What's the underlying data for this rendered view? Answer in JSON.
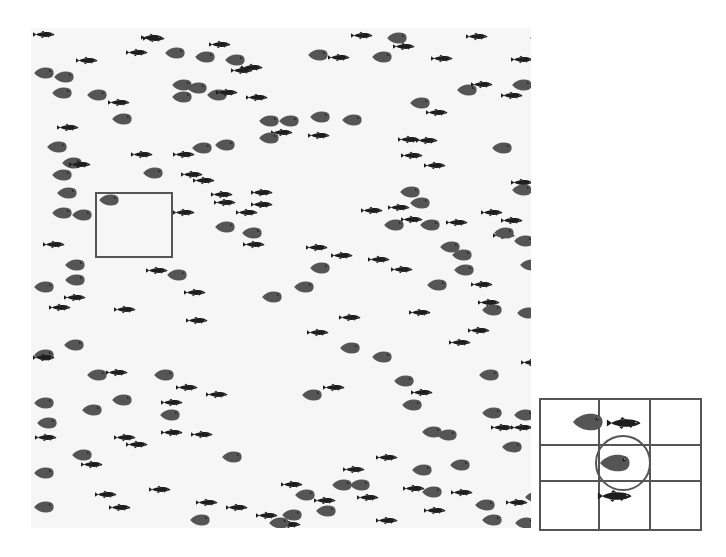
{
  "figure": {
    "colors": {
      "panel_bg": "#f6f6f6",
      "round_fish": "#555555",
      "small_fish": "#1e1e1e",
      "box_line": "#555555"
    }
  },
  "main_panel": {
    "x": 31,
    "y": 28,
    "width": 500,
    "height": 500
  },
  "selection_box": {
    "x": 95,
    "y": 192,
    "width": 78,
    "height": 66
  },
  "inset": {
    "x": 539,
    "y": 398,
    "width": 163,
    "height": 133,
    "grid": {
      "cols_x": [
        57,
        108
      ],
      "rows_y": [
        44,
        80
      ]
    },
    "circle": {
      "cx": 82,
      "cy": 63,
      "r": 28
    },
    "fish": [
      {
        "type": "round",
        "x": 28,
        "y": 12,
        "w": 38,
        "h": 20
      },
      {
        "type": "small",
        "x": 64,
        "y": 17,
        "w": 38,
        "h": 12
      },
      {
        "type": "round",
        "x": 57,
        "y": 53,
        "w": 34,
        "h": 20
      },
      {
        "type": "small",
        "x": 55,
        "y": 90,
        "w": 38,
        "h": 12
      }
    ]
  },
  "fish": [
    {
      "t": "s",
      "x": 2,
      "y": 2
    },
    {
      "t": "s",
      "x": 112,
      "y": 6
    },
    {
      "t": "r",
      "x": 133,
      "y": 18
    },
    {
      "t": "s",
      "x": 178,
      "y": 12
    },
    {
      "t": "s",
      "x": 210,
      "y": 35
    },
    {
      "t": "r",
      "x": 163,
      "y": 22
    },
    {
      "t": "r",
      "x": 2,
      "y": 38
    },
    {
      "t": "r",
      "x": 22,
      "y": 42
    },
    {
      "t": "r",
      "x": 20,
      "y": 58
    },
    {
      "t": "r",
      "x": 55,
      "y": 60
    },
    {
      "t": "s",
      "x": 77,
      "y": 70
    },
    {
      "t": "r",
      "x": 80,
      "y": 84
    },
    {
      "t": "s",
      "x": 26,
      "y": 95
    },
    {
      "t": "r",
      "x": 140,
      "y": 50
    },
    {
      "t": "r",
      "x": 155,
      "y": 53
    },
    {
      "t": "r",
      "x": 140,
      "y": 62
    },
    {
      "t": "r",
      "x": 175,
      "y": 60
    },
    {
      "t": "s",
      "x": 185,
      "y": 60
    },
    {
      "t": "s",
      "x": 215,
      "y": 65
    },
    {
      "t": "r",
      "x": 227,
      "y": 86
    },
    {
      "t": "r",
      "x": 247,
      "y": 86
    },
    {
      "t": "s",
      "x": 240,
      "y": 100
    },
    {
      "t": "r",
      "x": 227,
      "y": 103
    },
    {
      "t": "r",
      "x": 15,
      "y": 112
    },
    {
      "t": "s",
      "x": 100,
      "y": 122
    },
    {
      "t": "s",
      "x": 142,
      "y": 122
    },
    {
      "t": "r",
      "x": 160,
      "y": 113
    },
    {
      "t": "r",
      "x": 183,
      "y": 110
    },
    {
      "t": "s",
      "x": 150,
      "y": 142
    },
    {
      "t": "r",
      "x": 30,
      "y": 128
    },
    {
      "t": "r",
      "x": 20,
      "y": 140
    },
    {
      "t": "s",
      "x": 38,
      "y": 132
    },
    {
      "t": "r",
      "x": 25,
      "y": 158
    },
    {
      "t": "s",
      "x": 180,
      "y": 162
    },
    {
      "t": "s",
      "x": 220,
      "y": 160
    },
    {
      "t": "s",
      "x": 205,
      "y": 180
    },
    {
      "t": "r",
      "x": 67,
      "y": 165
    },
    {
      "t": "r",
      "x": 20,
      "y": 178
    },
    {
      "t": "s",
      "x": 12,
      "y": 212
    },
    {
      "t": "r",
      "x": 40,
      "y": 180
    },
    {
      "t": "s",
      "x": 95,
      "y": 20
    },
    {
      "t": "r",
      "x": 111,
      "y": 138
    },
    {
      "t": "s",
      "x": 45,
      "y": 28
    },
    {
      "t": "s",
      "x": 162,
      "y": 148
    },
    {
      "t": "s",
      "x": 220,
      "y": 172
    },
    {
      "t": "s",
      "x": 183,
      "y": 170
    },
    {
      "t": "r",
      "x": 183,
      "y": 192
    },
    {
      "t": "r",
      "x": 210,
      "y": 198
    },
    {
      "t": "s",
      "x": 142,
      "y": 180
    },
    {
      "t": "s",
      "x": 212,
      "y": 212
    },
    {
      "t": "r",
      "x": 33,
      "y": 230
    },
    {
      "t": "r",
      "x": 33,
      "y": 245
    },
    {
      "t": "r",
      "x": 135,
      "y": 240
    },
    {
      "t": "s",
      "x": 115,
      "y": 238
    },
    {
      "t": "r",
      "x": 2,
      "y": 252
    },
    {
      "t": "s",
      "x": 33,
      "y": 265
    },
    {
      "t": "s",
      "x": 18,
      "y": 275
    },
    {
      "t": "s",
      "x": 83,
      "y": 277
    },
    {
      "t": "s",
      "x": 153,
      "y": 260
    },
    {
      "t": "r",
      "x": 230,
      "y": 262
    },
    {
      "t": "s",
      "x": 155,
      "y": 288
    },
    {
      "t": "r",
      "x": 32,
      "y": 310
    },
    {
      "t": "r",
      "x": 2,
      "y": 320
    },
    {
      "t": "s",
      "x": 2,
      "y": 325
    },
    {
      "t": "r",
      "x": 55,
      "y": 340
    },
    {
      "t": "s",
      "x": 75,
      "y": 340
    },
    {
      "t": "r",
      "x": 122,
      "y": 340
    },
    {
      "t": "s",
      "x": 145,
      "y": 355
    },
    {
      "t": "s",
      "x": 175,
      "y": 362
    },
    {
      "t": "r",
      "x": 2,
      "y": 368
    },
    {
      "t": "r",
      "x": 80,
      "y": 365
    },
    {
      "t": "r",
      "x": 50,
      "y": 375
    },
    {
      "t": "s",
      "x": 130,
      "y": 370
    },
    {
      "t": "r",
      "x": 128,
      "y": 380
    },
    {
      "t": "r",
      "x": 5,
      "y": 388
    },
    {
      "t": "s",
      "x": 4,
      "y": 405
    },
    {
      "t": "s",
      "x": 83,
      "y": 405
    },
    {
      "t": "s",
      "x": 95,
      "y": 412
    },
    {
      "t": "s",
      "x": 130,
      "y": 400
    },
    {
      "t": "s",
      "x": 160,
      "y": 402
    },
    {
      "t": "r",
      "x": 40,
      "y": 420
    },
    {
      "t": "s",
      "x": 50,
      "y": 432
    },
    {
      "t": "r",
      "x": 2,
      "y": 438
    },
    {
      "t": "s",
      "x": 64,
      "y": 462
    },
    {
      "t": "s",
      "x": 118,
      "y": 457
    },
    {
      "t": "r",
      "x": 2,
      "y": 472
    },
    {
      "t": "s",
      "x": 78,
      "y": 475
    },
    {
      "t": "r",
      "x": 158,
      "y": 485
    },
    {
      "t": "s",
      "x": 165,
      "y": 470
    },
    {
      "t": "s",
      "x": 195,
      "y": 475
    },
    {
      "t": "s",
      "x": 225,
      "y": 483
    },
    {
      "t": "s",
      "x": 248,
      "y": 492
    },
    {
      "t": "r",
      "x": 237,
      "y": 488
    },
    {
      "t": "r",
      "x": 190,
      "y": 422
    },
    {
      "t": "r",
      "x": 250,
      "y": 480
    },
    {
      "t": "s",
      "x": 110,
      "y": 5
    },
    {
      "t": "r",
      "x": 193,
      "y": 25
    },
    {
      "t": "s",
      "x": 200,
      "y": 38
    },
    {
      "t": "r",
      "x": 276,
      "y": 20
    },
    {
      "t": "s",
      "x": 297,
      "y": 25
    },
    {
      "t": "s",
      "x": 320,
      "y": 3
    },
    {
      "t": "r",
      "x": 355,
      "y": 3
    },
    {
      "t": "s",
      "x": 435,
      "y": 4
    },
    {
      "t": "r",
      "x": 498,
      "y": 3
    },
    {
      "t": "r",
      "x": 340,
      "y": 22
    },
    {
      "t": "s",
      "x": 362,
      "y": 14
    },
    {
      "t": "s",
      "x": 400,
      "y": 26
    },
    {
      "t": "s",
      "x": 480,
      "y": 27
    },
    {
      "t": "r",
      "x": 480,
      "y": 50
    },
    {
      "t": "r",
      "x": 425,
      "y": 55
    },
    {
      "t": "s",
      "x": 440,
      "y": 52
    },
    {
      "t": "s",
      "x": 470,
      "y": 63
    },
    {
      "t": "r",
      "x": 278,
      "y": 82
    },
    {
      "t": "r",
      "x": 378,
      "y": 68
    },
    {
      "t": "s",
      "x": 395,
      "y": 80
    },
    {
      "t": "r",
      "x": 310,
      "y": 85
    },
    {
      "t": "s",
      "x": 277,
      "y": 103
    },
    {
      "t": "s",
      "x": 367,
      "y": 107
    },
    {
      "t": "s",
      "x": 385,
      "y": 108
    },
    {
      "t": "s",
      "x": 370,
      "y": 123
    },
    {
      "t": "r",
      "x": 460,
      "y": 113
    },
    {
      "t": "s",
      "x": 393,
      "y": 133
    },
    {
      "t": "s",
      "x": 480,
      "y": 150
    },
    {
      "t": "r",
      "x": 368,
      "y": 157
    },
    {
      "t": "r",
      "x": 378,
      "y": 168
    },
    {
      "t": "s",
      "x": 357,
      "y": 175
    },
    {
      "t": "r",
      "x": 352,
      "y": 190
    },
    {
      "t": "r",
      "x": 388,
      "y": 190
    },
    {
      "t": "s",
      "x": 330,
      "y": 178
    },
    {
      "t": "s",
      "x": 415,
      "y": 190
    },
    {
      "t": "s",
      "x": 450,
      "y": 180
    },
    {
      "t": "s",
      "x": 470,
      "y": 188
    },
    {
      "t": "s",
      "x": 462,
      "y": 203
    },
    {
      "t": "r",
      "x": 462,
      "y": 198
    },
    {
      "t": "r",
      "x": 482,
      "y": 206
    },
    {
      "t": "s",
      "x": 370,
      "y": 187
    },
    {
      "t": "r",
      "x": 480,
      "y": 155
    },
    {
      "t": "s",
      "x": 275,
      "y": 215
    },
    {
      "t": "s",
      "x": 300,
      "y": 223
    },
    {
      "t": "r",
      "x": 278,
      "y": 233
    },
    {
      "t": "s",
      "x": 337,
      "y": 227
    },
    {
      "t": "s",
      "x": 360,
      "y": 237
    },
    {
      "t": "r",
      "x": 408,
      "y": 212
    },
    {
      "t": "r",
      "x": 420,
      "y": 220
    },
    {
      "t": "r",
      "x": 422,
      "y": 235
    },
    {
      "t": "r",
      "x": 395,
      "y": 250
    },
    {
      "t": "s",
      "x": 440,
      "y": 252
    },
    {
      "t": "r",
      "x": 488,
      "y": 230
    },
    {
      "t": "s",
      "x": 447,
      "y": 270
    },
    {
      "t": "r",
      "x": 450,
      "y": 275
    },
    {
      "t": "s",
      "x": 378,
      "y": 280
    },
    {
      "t": "r",
      "x": 485,
      "y": 278
    },
    {
      "t": "r",
      "x": 503,
      "y": 255
    },
    {
      "t": "r",
      "x": 262,
      "y": 252
    },
    {
      "t": "s",
      "x": 308,
      "y": 285
    },
    {
      "t": "s",
      "x": 276,
      "y": 300
    },
    {
      "t": "r",
      "x": 308,
      "y": 313
    },
    {
      "t": "r",
      "x": 340,
      "y": 322
    },
    {
      "t": "r",
      "x": 362,
      "y": 346
    },
    {
      "t": "s",
      "x": 418,
      "y": 310
    },
    {
      "t": "s",
      "x": 437,
      "y": 298
    },
    {
      "t": "r",
      "x": 447,
      "y": 340
    },
    {
      "t": "s",
      "x": 490,
      "y": 330
    },
    {
      "t": "r",
      "x": 270,
      "y": 360
    },
    {
      "t": "s",
      "x": 292,
      "y": 355
    },
    {
      "t": "r",
      "x": 370,
      "y": 370
    },
    {
      "t": "s",
      "x": 380,
      "y": 360
    },
    {
      "t": "r",
      "x": 390,
      "y": 397
    },
    {
      "t": "r",
      "x": 450,
      "y": 378
    },
    {
      "t": "r",
      "x": 482,
      "y": 380
    },
    {
      "t": "s",
      "x": 460,
      "y": 395
    },
    {
      "t": "s",
      "x": 480,
      "y": 395
    },
    {
      "t": "s",
      "x": 500,
      "y": 405
    },
    {
      "t": "r",
      "x": 470,
      "y": 412
    },
    {
      "t": "r",
      "x": 418,
      "y": 430
    },
    {
      "t": "r",
      "x": 380,
      "y": 435
    },
    {
      "t": "s",
      "x": 345,
      "y": 425
    },
    {
      "t": "r",
      "x": 390,
      "y": 457
    },
    {
      "t": "s",
      "x": 372,
      "y": 456
    },
    {
      "t": "s",
      "x": 420,
      "y": 460
    },
    {
      "t": "r",
      "x": 493,
      "y": 462
    },
    {
      "t": "s",
      "x": 475,
      "y": 470
    },
    {
      "t": "r",
      "x": 443,
      "y": 470
    },
    {
      "t": "r",
      "x": 263,
      "y": 460
    },
    {
      "t": "s",
      "x": 283,
      "y": 468
    },
    {
      "t": "r",
      "x": 318,
      "y": 450
    },
    {
      "t": "r",
      "x": 300,
      "y": 450
    },
    {
      "t": "s",
      "x": 326,
      "y": 465
    },
    {
      "t": "s",
      "x": 312,
      "y": 437
    },
    {
      "t": "r",
      "x": 284,
      "y": 476
    },
    {
      "t": "s",
      "x": 250,
      "y": 452
    },
    {
      "t": "r",
      "x": 405,
      "y": 400
    },
    {
      "t": "r",
      "x": 450,
      "y": 485
    },
    {
      "t": "s",
      "x": 345,
      "y": 488
    },
    {
      "t": "s",
      "x": 393,
      "y": 478
    },
    {
      "t": "r",
      "x": 483,
      "y": 488
    }
  ]
}
